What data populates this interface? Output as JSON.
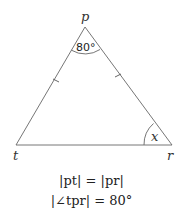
{
  "figure": {
    "type": "isosceles triangle",
    "vertices": {
      "p": {
        "label": "p",
        "x": 85,
        "y": 27
      },
      "t": {
        "label": "t",
        "x": 16,
        "y": 145
      },
      "r": {
        "label": "r",
        "x": 172,
        "y": 145
      }
    },
    "angle_at_p": "80°",
    "angle_at_r": "x",
    "tick_marks": [
      "pt",
      "pr"
    ]
  },
  "equations": {
    "line1": "|pt| = |pr|",
    "line2": "|∠tpr| = 80°"
  },
  "colors": {
    "line": "#555555",
    "text": "#222222"
  }
}
